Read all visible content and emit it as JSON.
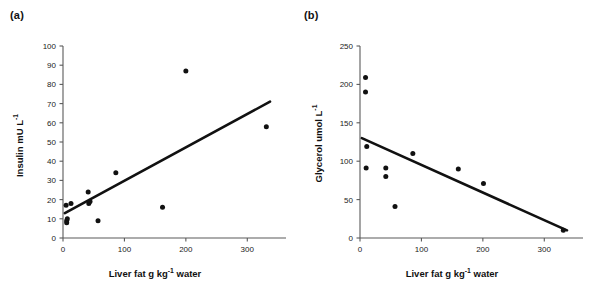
{
  "figure": {
    "background_color": "#ffffff",
    "marker_color": "#111111",
    "line_color": "#111111",
    "axis_color": "#5a5a5a",
    "panels": [
      {
        "id": "a",
        "label": "(a)",
        "ylabel_main": "Insulin mU L",
        "ylabel_sup": "-1",
        "xlabel_pre": "Liver fat g kg",
        "xlabel_sup": "-1",
        "xlabel_post": " water"
      },
      {
        "id": "b",
        "label": "(b)",
        "ylabel_main": "Glycerol umol L",
        "ylabel_sup": "-1",
        "xlabel_pre": "Liver fat g kg",
        "xlabel_sup": "-1",
        "xlabel_post": " water"
      }
    ]
  },
  "chart_data": [
    {
      "type": "scatter",
      "panel": "a",
      "title": "(a)",
      "xlabel": "Liver fat g kg-1 water",
      "ylabel": "Insulin mU L-1",
      "xlim": [
        0,
        350
      ],
      "ylim": [
        0,
        100
      ],
      "xticks": [
        0,
        100,
        200,
        300
      ],
      "xticklabels": [
        "0",
        "100",
        "200",
        "300"
      ],
      "yticks": [
        0,
        10,
        20,
        30,
        40,
        50,
        60,
        70,
        80,
        90,
        100
      ],
      "yticklabels": [
        "0",
        "10",
        "20",
        "30",
        "40",
        "50",
        "60",
        "70",
        "80",
        "90",
        "100"
      ],
      "grid": false,
      "legend": "none",
      "points": [
        {
          "x": 5,
          "y": 17
        },
        {
          "x": 6,
          "y": 9
        },
        {
          "x": 6,
          "y": 8
        },
        {
          "x": 7,
          "y": 10
        },
        {
          "x": 13,
          "y": 18
        },
        {
          "x": 41,
          "y": 24
        },
        {
          "x": 42,
          "y": 18
        },
        {
          "x": 44,
          "y": 19
        },
        {
          "x": 57,
          "y": 9
        },
        {
          "x": 86,
          "y": 34
        },
        {
          "x": 162,
          "y": 16
        },
        {
          "x": 200,
          "y": 87
        },
        {
          "x": 331,
          "y": 58
        }
      ],
      "trendline": {
        "x_start": 3,
        "y_start": 13,
        "x_end": 337,
        "y_end": 71,
        "direction": "positive"
      }
    },
    {
      "type": "scatter",
      "panel": "b",
      "title": "(b)",
      "xlabel": "Liver fat g kg-1 water",
      "ylabel": "Glycerol umol L-1",
      "xlim": [
        0,
        350
      ],
      "ylim": [
        0,
        250
      ],
      "xticks": [
        0,
        100,
        200,
        300
      ],
      "xticklabels": [
        "0",
        "100",
        "200",
        "300"
      ],
      "yticks": [
        0,
        50,
        100,
        150,
        200,
        250
      ],
      "yticklabels": [
        "0",
        "50",
        "100",
        "150",
        "200",
        "250"
      ],
      "grid": false,
      "legend": "none",
      "points": [
        {
          "x": 9,
          "y": 209
        },
        {
          "x": 9,
          "y": 190
        },
        {
          "x": 11,
          "y": 119
        },
        {
          "x": 10,
          "y": 91
        },
        {
          "x": 42,
          "y": 91
        },
        {
          "x": 42,
          "y": 80
        },
        {
          "x": 57,
          "y": 41
        },
        {
          "x": 86,
          "y": 110
        },
        {
          "x": 160,
          "y": 90
        },
        {
          "x": 201,
          "y": 71
        },
        {
          "x": 331,
          "y": 10
        }
      ],
      "trendline": {
        "x_start": 3,
        "y_start": 130,
        "x_end": 337,
        "y_end": 10,
        "direction": "negative"
      }
    }
  ]
}
